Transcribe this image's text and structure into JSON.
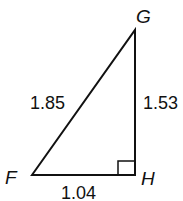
{
  "diagram": {
    "type": "right-triangle",
    "vertices": {
      "F": {
        "label": "F"
      },
      "G": {
        "label": "G"
      },
      "H": {
        "label": "H"
      }
    },
    "sides": {
      "FG": {
        "label": "1.85"
      },
      "GH": {
        "label": "1.53"
      },
      "FH": {
        "label": "1.04"
      }
    },
    "right_angle_at": "H"
  }
}
